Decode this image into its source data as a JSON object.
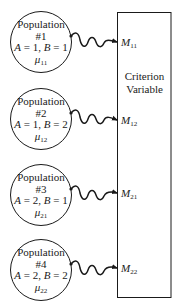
{
  "criterion_box": {
    "line1": "Criterion",
    "line2": "Variable"
  },
  "populations": [
    {
      "title": "Population",
      "number": "#1",
      "a_label": "A",
      "a_value": "1",
      "b_label": "B",
      "b_value": "1",
      "mu_symbol": "μ",
      "mu_sub": "11",
      "m_symbol": "M",
      "m_sub": "11"
    },
    {
      "title": "Population",
      "number": "#2",
      "a_label": "A",
      "a_value": "1",
      "b_label": "B",
      "b_value": "2",
      "mu_symbol": "μ",
      "mu_sub": "12",
      "m_symbol": "M",
      "m_sub": "12"
    },
    {
      "title": "Population",
      "number": "#3",
      "a_label": "A",
      "a_value": "2",
      "b_label": "B",
      "b_value": "1",
      "mu_symbol": "μ",
      "mu_sub": "21",
      "m_symbol": "M",
      "m_sub": "21"
    },
    {
      "title": "Population",
      "number": "#4",
      "a_label": "A",
      "a_value": "2",
      "b_label": "B",
      "b_value": "2",
      "mu_symbol": "μ",
      "mu_sub": "22",
      "m_symbol": "M",
      "m_sub": "22"
    }
  ],
  "colors": {
    "stroke": "#1a1a1a",
    "background": "#ffffff"
  }
}
